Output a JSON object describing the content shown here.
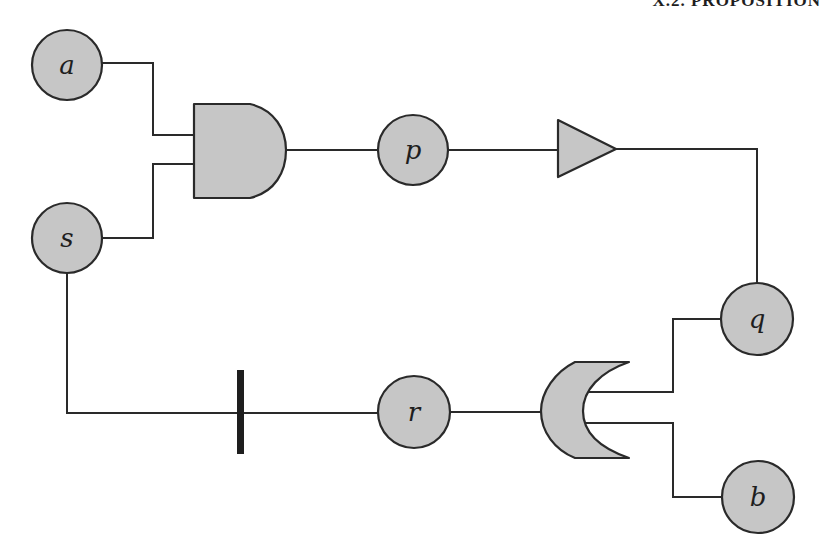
{
  "page": {
    "running_head": "X.2. PROPOSITION"
  },
  "diagram": {
    "colors": {
      "node_fill": "#c6c6c6",
      "stroke": "#2a2a2a",
      "background": "#ffffff"
    },
    "nodes": [
      {
        "id": "a",
        "label": "a",
        "cx": 67,
        "cy": 65,
        "r": 35
      },
      {
        "id": "s",
        "label": "s",
        "cx": 67,
        "cy": 238,
        "r": 35
      },
      {
        "id": "p",
        "label": "p",
        "cx": 413,
        "cy": 150,
        "r": 35
      },
      {
        "id": "q",
        "label": "q",
        "cx": 757,
        "cy": 319,
        "r": 36
      },
      {
        "id": "r",
        "label": "r",
        "cx": 414,
        "cy": 412,
        "r": 36
      },
      {
        "id": "b",
        "label": "b",
        "cx": 758,
        "cy": 497,
        "r": 36
      }
    ],
    "gates": [
      {
        "id": "and-gate",
        "type": "AND",
        "inputs": [
          "a",
          "s"
        ],
        "output": "p"
      },
      {
        "id": "buffer-gate",
        "type": "BUFFER",
        "inputs": [
          "p"
        ],
        "output": "q"
      },
      {
        "id": "or-gate",
        "type": "OR",
        "orientation": "left",
        "inputs": [
          "q",
          "b"
        ],
        "output": "r"
      },
      {
        "id": "not-bar",
        "type": "NEGATION_BAR",
        "inputs": [
          "s"
        ],
        "output": "r"
      }
    ],
    "labels": {
      "a": "a",
      "s": "s",
      "p": "p",
      "q": "q",
      "r": "r",
      "b": "b"
    }
  }
}
